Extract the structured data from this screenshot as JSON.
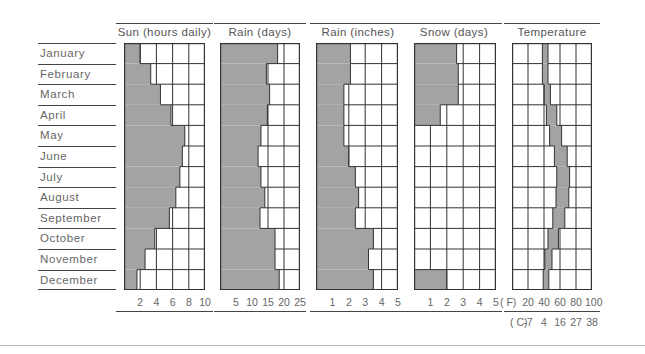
{
  "chart_data": {
    "type": "bar",
    "title": "",
    "categories": [
      "January",
      "February",
      "March",
      "April",
      "May",
      "June",
      "July",
      "August",
      "September",
      "October",
      "November",
      "December"
    ],
    "panels": [
      {
        "id": "sun",
        "title": "Sun (hours daily)",
        "kind": "bar",
        "xlim": [
          0,
          10
        ],
        "ticks": [
          2,
          4,
          6,
          8,
          10
        ],
        "tick_labels": [
          "2",
          "4",
          "6",
          "8",
          "10"
        ],
        "grid_step": 2,
        "values": [
          2.0,
          3.3,
          4.5,
          5.8,
          7.5,
          7.2,
          6.9,
          6.4,
          5.6,
          3.8,
          2.6,
          1.6
        ]
      },
      {
        "id": "rain_days",
        "title": "Rain (days)",
        "kind": "bar",
        "xlim": [
          0,
          25
        ],
        "ticks": [
          5,
          10,
          15,
          20,
          25
        ],
        "tick_labels": [
          "5",
          "10",
          "15",
          "20",
          "25"
        ],
        "grid_step": 5,
        "values": [
          18,
          14.5,
          15.5,
          14.8,
          12.8,
          11.9,
          12.8,
          14,
          12.5,
          17.2,
          17.2,
          18.5
        ]
      },
      {
        "id": "rain_inches",
        "title": "Rain (inches)",
        "kind": "bar",
        "xlim": [
          0,
          5
        ],
        "ticks": [
          1,
          2,
          3,
          4,
          5
        ],
        "tick_labels": [
          "1",
          "2",
          "3",
          "4",
          "5"
        ],
        "grid_step": 1,
        "values": [
          2.1,
          2.1,
          1.7,
          1.7,
          1.7,
          2.0,
          2.4,
          2.6,
          2.4,
          3.5,
          3.2,
          3.5
        ]
      },
      {
        "id": "snow_days",
        "title": "Snow (days)",
        "kind": "bar",
        "xlim": [
          0,
          5
        ],
        "ticks": [
          1,
          2,
          3,
          4,
          5
        ],
        "tick_labels": [
          "1",
          "2",
          "3",
          "4",
          "5"
        ],
        "grid_step": 1,
        "values": [
          2.6,
          2.7,
          2.7,
          1.6,
          0,
          0,
          0,
          0,
          0,
          0,
          0,
          2.0
        ]
      },
      {
        "id": "temperature",
        "title": "Temperature",
        "kind": "range",
        "xlim": [
          0,
          100
        ],
        "unit_f_label": "(°F)",
        "unit_c_label": "(°C)",
        "ticks": [
          20,
          40,
          60,
          80,
          100
        ],
        "tick_labels": [
          "20",
          "40",
          "60",
          "80",
          "100"
        ],
        "ticks_c_labels": [
          "-7",
          "4",
          "16",
          "27",
          "38"
        ],
        "grid_step": 20,
        "min": [
          38,
          38,
          40,
          43,
          47,
          53,
          56,
          55,
          51,
          45,
          41,
          39
        ],
        "max": [
          45,
          45,
          48,
          56,
          62,
          69,
          72,
          71,
          66,
          58,
          50,
          46
        ]
      }
    ],
    "xlabel": "",
    "ylabel": "",
    "grid": true,
    "legend": "none"
  },
  "colors": {
    "fill": "#a3a3a3",
    "grid_line": "#333333",
    "text": "#666666"
  },
  "labels": {
    "unit_f": "( F)",
    "unit_c": "( C)"
  }
}
